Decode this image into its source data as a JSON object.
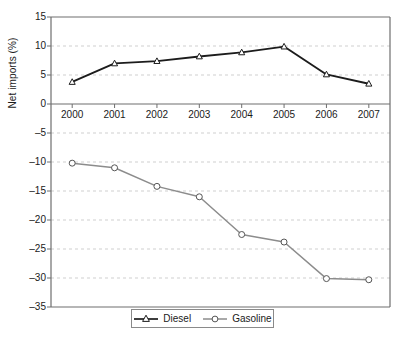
{
  "chart_data": {
    "type": "line",
    "title": "",
    "xlabel": "",
    "ylabel": "Net imports (%)",
    "categories": [
      "2000",
      "2001",
      "2002",
      "2003",
      "2004",
      "2005",
      "2006",
      "2007"
    ],
    "x": [
      2000,
      2001,
      2002,
      2003,
      2004,
      2005,
      2006,
      2007
    ],
    "ylim": [
      -35,
      15
    ],
    "ytick_step": 5,
    "yticks": [
      15,
      10,
      5,
      0,
      -5,
      -10,
      -15,
      -20,
      -25,
      -30,
      -35
    ],
    "ytick_labels": [
      "15",
      "10",
      "5",
      "0",
      "–5",
      "–10",
      "–15",
      "–20",
      "–25",
      "–30",
      "–35"
    ],
    "grid": true,
    "grid_style": "dashed",
    "grid_color": "#cfcfcf",
    "legend_position": "bottom-center",
    "series": [
      {
        "name": "Diesel",
        "color": "#1c1c1c",
        "marker": "triangle-open",
        "values": [
          3.8,
          7.0,
          7.4,
          8.2,
          8.9,
          9.9,
          5.1,
          3.5
        ]
      },
      {
        "name": "Gasoline",
        "color": "#8c8c8c",
        "marker": "circle-open",
        "values": [
          -10.2,
          -11.0,
          -14.2,
          -16.0,
          -22.5,
          -23.8,
          -30.1,
          -30.3
        ]
      }
    ]
  },
  "axes": {
    "frame_color": "#6e6e6e",
    "zero_line_color": "#6e6e6e"
  },
  "legend": {
    "items": [
      {
        "label": "Diesel"
      },
      {
        "label": "Gasoline"
      }
    ]
  }
}
